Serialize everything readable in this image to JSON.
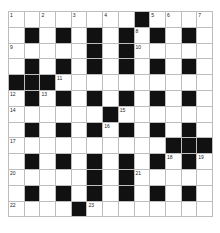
{
  "puzzle": {
    "rows": 13,
    "cols": 13,
    "colors": {
      "black": "#111111",
      "white": "#ffffff",
      "line": "#bdbdbd"
    },
    "grid": [
      "........#....",
      ".#.#.#.#.#.#.",
      ".....#.#.....",
      ".#.#.#.#.#.#.",
      "###..........",
      ".#.#.#.#.#.#.",
      "......#......",
      ".#.#.#.#.#.#.",
      "..........###",
      ".#.#.#.#.#.#.",
      ".....#.#.....",
      ".#.#.#.#.#.#.",
      "....#........"
    ],
    "numbers": [
      {
        "r": 0,
        "c": 0,
        "n": "1"
      },
      {
        "r": 0,
        "c": 2,
        "n": "2"
      },
      {
        "r": 0,
        "c": 4,
        "n": "3"
      },
      {
        "r": 0,
        "c": 6,
        "n": "4"
      },
      {
        "r": 0,
        "c": 9,
        "n": "5"
      },
      {
        "r": 0,
        "c": 10,
        "n": "6"
      },
      {
        "r": 0,
        "c": 12,
        "n": "7"
      },
      {
        "r": 1,
        "c": 8,
        "n": "8"
      },
      {
        "r": 2,
        "c": 0,
        "n": "9"
      },
      {
        "r": 2,
        "c": 8,
        "n": "10"
      },
      {
        "r": 4,
        "c": 3,
        "n": "11"
      },
      {
        "r": 5,
        "c": 0,
        "n": "12"
      },
      {
        "r": 5,
        "c": 2,
        "n": "13"
      },
      {
        "r": 6,
        "c": 0,
        "n": "14"
      },
      {
        "r": 6,
        "c": 7,
        "n": "15"
      },
      {
        "r": 7,
        "c": 6,
        "n": "16"
      },
      {
        "r": 8,
        "c": 0,
        "n": "17"
      },
      {
        "r": 9,
        "c": 10,
        "n": "18"
      },
      {
        "r": 9,
        "c": 12,
        "n": "19"
      },
      {
        "r": 10,
        "c": 0,
        "n": "20"
      },
      {
        "r": 10,
        "c": 8,
        "n": "21"
      },
      {
        "r": 12,
        "c": 0,
        "n": "22"
      },
      {
        "r": 12,
        "c": 5,
        "n": "23"
      }
    ]
  }
}
